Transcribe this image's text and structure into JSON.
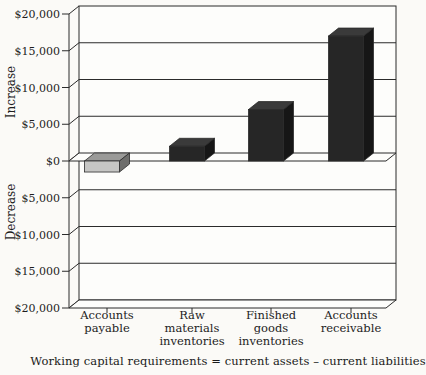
{
  "page": {
    "background": "#fbfaf7"
  },
  "chart_data": {
    "type": "bar",
    "style": "3d-column",
    "title": "",
    "caption": "Working capital requirements = current assets – current liabilities",
    "categories": [
      "Accounts\npayable",
      "Raw\nmaterials\ninventories",
      "Finished\ngoods\ninventories",
      "Accounts\nreceivable"
    ],
    "values": [
      -1500,
      2000,
      7000,
      17000
    ],
    "bar_styles": [
      "gray",
      "black",
      "black",
      "black"
    ],
    "axis_increase_label": "Increase",
    "axis_decrease_label": "Decrease",
    "y_ticks": [
      {
        "label": "$20,000",
        "value": 20000
      },
      {
        "label": "$15,000",
        "value": 15000
      },
      {
        "label": "$10,000",
        "value": 10000
      },
      {
        "label": "$5,000",
        "value": 5000
      },
      {
        "label": "$0",
        "value": 0
      },
      {
        "label": "$5,000",
        "value": -5000
      },
      {
        "label": "$10,000",
        "value": -10000
      },
      {
        "label": "$15,000",
        "value": -15000
      },
      {
        "label": "$20,000",
        "value": -20000
      }
    ],
    "ylim": [
      -20000,
      20000
    ],
    "grid": true,
    "legend": "none",
    "colors": {
      "black_bar_front": "#262626",
      "black_bar_top": "#3a3a3a",
      "black_bar_side": "#161616",
      "gray_bar_front": "#c6c6c4",
      "gray_bar_top": "#9a9a98",
      "gray_bar_side": "#6e6e6c",
      "line": "#2b2b2b",
      "wall": "#fdfdfb"
    }
  }
}
